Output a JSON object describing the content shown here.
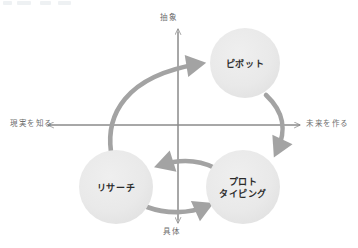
{
  "diagram": {
    "axes": {
      "top_label": "抽象",
      "bottom_label": "具体",
      "left_label": "現実を知る",
      "right_label": "未来を作る"
    },
    "nodes": [
      {
        "id": "pivot",
        "label": "ピボット",
        "cx": 245,
        "cy": 63,
        "r": 35
      },
      {
        "id": "research",
        "label": "リサーチ",
        "cx": 116,
        "cy": 187,
        "r": 37
      },
      {
        "id": "prototyping",
        "label": "プロト\nタイピング",
        "cx": 243,
        "cy": 187,
        "r": 37
      }
    ],
    "arrows": [
      {
        "id": "research-to-pivot",
        "from": "research",
        "to": "pivot"
      },
      {
        "id": "pivot-to-prototyping",
        "from": "pivot",
        "to": "prototyping"
      },
      {
        "id": "prototyping-to-research",
        "from": "prototyping",
        "to": "research"
      },
      {
        "id": "research-to-prototyping",
        "from": "research",
        "to": "prototyping"
      }
    ],
    "colors": {
      "node_fill": "#e8e8e8",
      "arrow": "#a3a3a3",
      "axis": "#8a8a8a",
      "node_text": "#2b2b2b",
      "axis_text": "#6e6e6e",
      "background": "#ffffff"
    }
  }
}
